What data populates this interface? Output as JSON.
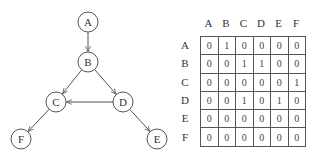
{
  "graph": {
    "nodes": [
      {
        "id": "A",
        "label": "A",
        "x": 88,
        "y": 22
      },
      {
        "id": "B",
        "label": "B",
        "x": 88,
        "y": 62
      },
      {
        "id": "C",
        "label": "C",
        "x": 56,
        "y": 102
      },
      {
        "id": "D",
        "label": "D",
        "x": 123,
        "y": 102
      },
      {
        "id": "E",
        "label": "E",
        "x": 157,
        "y": 139
      },
      {
        "id": "F",
        "label": "F",
        "x": 21,
        "y": 139
      }
    ],
    "edges": [
      {
        "from": "A",
        "to": "B"
      },
      {
        "from": "B",
        "to": "C"
      },
      {
        "from": "B",
        "to": "D"
      },
      {
        "from": "C",
        "to": "F"
      },
      {
        "from": "D",
        "to": "C"
      },
      {
        "from": "D",
        "to": "E"
      }
    ]
  },
  "matrix": {
    "col_headers": [
      "A",
      "B",
      "C",
      "D",
      "E",
      "F"
    ],
    "row_headers": [
      "A",
      "B",
      "C",
      "D",
      "E",
      "F"
    ],
    "rows": [
      [
        "0",
        "1",
        "0",
        "0",
        "0",
        "0"
      ],
      [
        "0",
        "0",
        "1",
        "1",
        "0",
        "0"
      ],
      [
        "0",
        "0",
        "0",
        "0",
        "0",
        "1"
      ],
      [
        "0",
        "0",
        "1",
        "0",
        "1",
        "0"
      ],
      [
        "0",
        "0",
        "0",
        "0",
        "0",
        "0"
      ],
      [
        "0",
        "0",
        "0",
        "0",
        "0",
        "0"
      ]
    ]
  }
}
